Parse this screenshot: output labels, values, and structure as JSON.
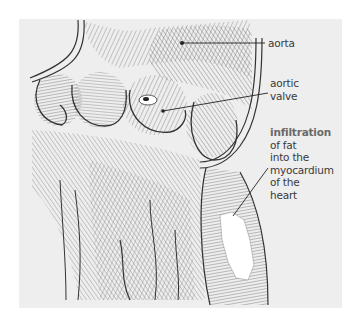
{
  "figure": {
    "background_color": "#eeeeee",
    "ink_color": "#3a3a3a",
    "fat_color": "#ffffff"
  },
  "labels": {
    "aorta": "aorta",
    "aortic_valve": [
      "aortic",
      "valve"
    ],
    "infiltration_heading": "infiltration",
    "infiltration_lines": [
      "of fat",
      "into the",
      "myocardium",
      "of the",
      "heart"
    ]
  }
}
